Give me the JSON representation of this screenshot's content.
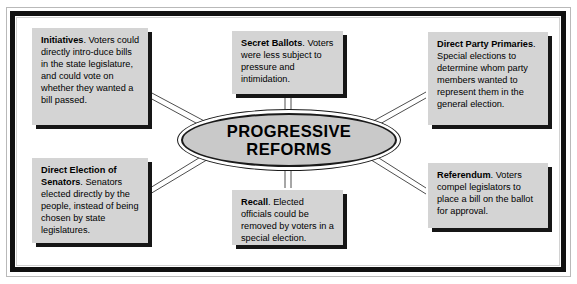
{
  "diagram": {
    "title": "Progressive Reforms",
    "type": "hub-and-spoke concept map",
    "center": {
      "label_line1": "PROGRESSIVE",
      "label_line2": "REFORMS",
      "fill_color": "#c9c9c9",
      "stroke_color": "#1a1a1a"
    },
    "frame": {
      "border_color": "#111111",
      "background_color": "#ffffff"
    },
    "box_style": {
      "fill_color": "#d4d4d4",
      "shadow_color": "#161616"
    },
    "nodes": [
      {
        "id": "initiatives",
        "term": "Initiatives",
        "body": ". Voters could directly intro-duce bills in the state legislature, and could vote on whether they wanted a bill passed.",
        "position": "top-left"
      },
      {
        "id": "secret-ballots",
        "term": "Secret Ballots",
        "body": ". Voters were less subject to pressure and intimidation.",
        "position": "top-center"
      },
      {
        "id": "direct-party-primaries",
        "term": "Direct Party Primaries",
        "body": ". Special elections to determine whom party members wanted to represent them in the general election.",
        "position": "top-right"
      },
      {
        "id": "direct-election-of-senators",
        "term": "Direct Election of Senators",
        "body": ". Senators elected directly by the people, instead of being chosen by state legislatures.",
        "position": "bottom-left"
      },
      {
        "id": "recall",
        "term": "Recall",
        "body": ".  Elected officials could be removed by voters in a special election.",
        "position": "bottom-center"
      },
      {
        "id": "referendum",
        "term": "Referendum",
        "body": ".  Voters compel legislators to place a bill on the ballot for approval.",
        "position": "bottom-right"
      }
    ]
  }
}
